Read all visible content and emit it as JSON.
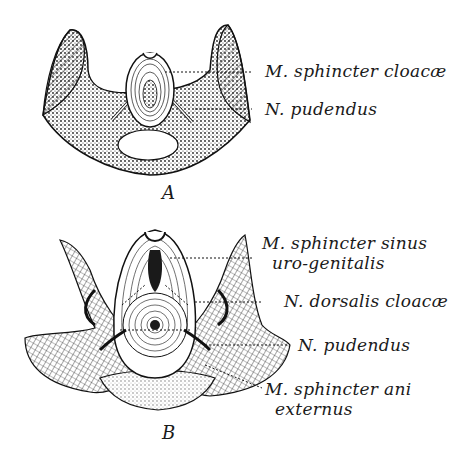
{
  "figure": {
    "panels": [
      {
        "letter": "A",
        "labels": [
          {
            "line1": "M. sphincter cloacæ",
            "line2": ""
          },
          {
            "line1": "N. pudendus",
            "line2": ""
          }
        ]
      },
      {
        "letter": "B",
        "labels": [
          {
            "line1": "M. sphincter sinus",
            "line2": "uro-genitalis"
          },
          {
            "line1": "N. dorsalis cloacæ",
            "line2": ""
          },
          {
            "line1": "N. pudendus",
            "line2": ""
          },
          {
            "line1": "M. sphincter ani",
            "line2": "externus"
          }
        ]
      }
    ]
  },
  "colors": {
    "ink": "#1a1a1a",
    "paper": "#ffffff"
  }
}
